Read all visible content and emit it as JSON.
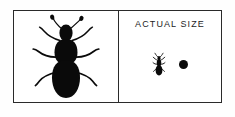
{
  "figure": {
    "name": "insect-identification-figure",
    "background_color": "#ffffff",
    "border_color": "#2a2a2a",
    "ink_color": "#0a0a0a"
  },
  "panels": {
    "specimen": {
      "name": "magnified-specimen-panel",
      "subject_icon": "beetle-icon",
      "subject_description": "beetle silhouette, magnified view"
    },
    "scale": {
      "name": "actual-size-panel",
      "label": "ACTUAL SIZE",
      "subject_icon": "beetle-icon",
      "reference_icon": "dot-icon",
      "reference_description": "black dot scale reference"
    }
  }
}
